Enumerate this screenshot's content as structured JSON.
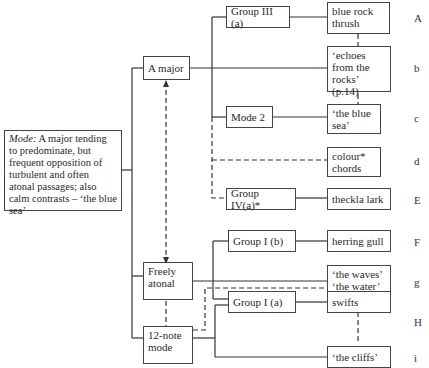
{
  "root": {
    "label_prefix": "Mode:",
    "text": "A major tending to predominate, but frequent opposition of turbulent and often atonal passages; also calm contrasts – ‘the blue sea’"
  },
  "modes": [
    {
      "id": "a-major",
      "label": "A major"
    },
    {
      "id": "freely-atonal",
      "label": "Freely atonal"
    },
    {
      "id": "twelve-note",
      "label": "12-note mode"
    }
  ],
  "groups": [
    {
      "id": "group-iii-a",
      "label": "Group III (a)"
    },
    {
      "id": "mode-2",
      "label": "Mode 2"
    },
    {
      "id": "group-iv-a",
      "label": "Group IV(a)*"
    },
    {
      "id": "group-i-b",
      "label": "Group I (b)"
    },
    {
      "id": "group-i-a",
      "label": "Group I (a)"
    }
  ],
  "items": [
    {
      "label": "blue rock thrush",
      "letter": "A"
    },
    {
      "label": "‘echoes from the rocks’ (p.14)",
      "letter": "b"
    },
    {
      "label": "‘the blue sea’",
      "letter": "c"
    },
    {
      "label": "colour* chords",
      "letter": "d"
    },
    {
      "label": "theckla lark",
      "letter": "E"
    },
    {
      "label": "herring gull",
      "letter": "F"
    },
    {
      "label": "‘the waves’ ‘the water’",
      "letter": "g"
    },
    {
      "label": "swifts",
      "letter": "H"
    },
    {
      "label": "‘the cliffs’",
      "letter": "i"
    }
  ],
  "colors": {
    "line": "#333333",
    "box_border": "#444444"
  }
}
